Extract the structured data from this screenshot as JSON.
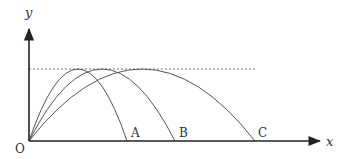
{
  "diagram": {
    "axes": {
      "x_label": "x",
      "y_label": "y",
      "origin_label": "O"
    },
    "max_height_line": {
      "style": "dotted",
      "description": "common maximum height"
    },
    "trajectories": [
      {
        "label": "A",
        "landing_point": "A"
      },
      {
        "label": "B",
        "landing_point": "B"
      },
      {
        "label": "C",
        "landing_point": "C"
      }
    ],
    "colors": {
      "axis": "#222222",
      "curve": "#555555",
      "dotted": "#777777",
      "text": "#333333"
    }
  }
}
